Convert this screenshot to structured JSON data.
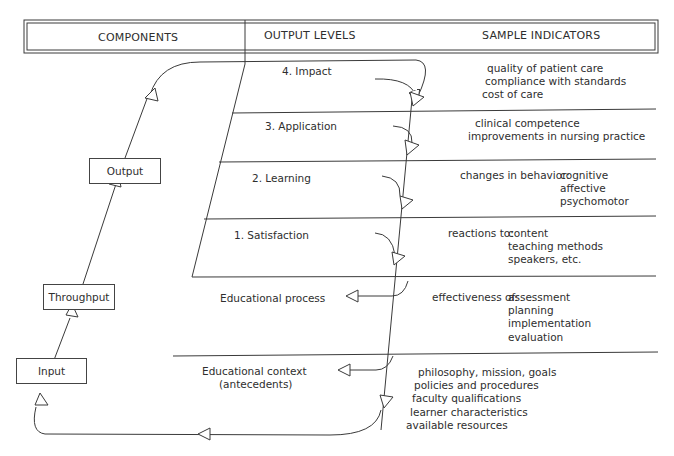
{
  "header": {
    "col1": "COMPONENTS",
    "col2": "OUTPUT LEVELS",
    "col3": "SAMPLE INDICATORS"
  },
  "components": {
    "output": "Output",
    "throughput": "Throughput",
    "input": "Input"
  },
  "levels": [
    {
      "label": "4.  Impact"
    },
    {
      "label": "3.  Application"
    },
    {
      "label": "2.  Learning"
    },
    {
      "label": "1.  Satisfaction"
    }
  ],
  "process": {
    "educational_process": "Educational process",
    "educational_context_line1": "Educational context",
    "educational_context_line2": "(antecedents)"
  },
  "indicators": {
    "impact": [
      "quality of patient care",
      "compliance with standards",
      "cost of care"
    ],
    "application": [
      "clinical competence",
      "improvements in nursing practice"
    ],
    "learning": {
      "prefix": "changes in behavior:",
      "items": [
        "cognitive",
        "affective",
        "psychomotor"
      ]
    },
    "satisfaction": {
      "prefix": "reactions to:",
      "items": [
        "content",
        "teaching methods",
        "speakers, etc."
      ]
    },
    "process": {
      "prefix": "effectiveness of:",
      "items": [
        "assessment",
        "planning",
        "implementation",
        "evaluation"
      ]
    },
    "context": [
      "philosophy, mission, goals",
      "policies and procedures",
      "faculty qualifications",
      "learner characteristics",
      "available resources"
    ]
  },
  "colors": {
    "line": "#3a3a3a",
    "text": "#2e2e2e",
    "background": "#ffffff"
  }
}
